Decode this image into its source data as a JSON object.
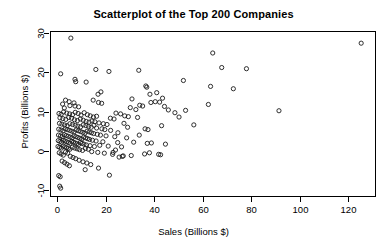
{
  "chart_data": {
    "type": "scatter",
    "title": "Scatterplot of the Top 200 Companies",
    "xlabel": "Sales (Billions $)",
    "ylabel": "Profits (Billions $)",
    "xlim": [
      -3,
      131
    ],
    "ylim": [
      -11.5,
      30.5
    ],
    "xticks": [
      0,
      20,
      40,
      60,
      80,
      100,
      120
    ],
    "xtick_labels": [
      "0",
      "20",
      "40",
      "60",
      "80",
      "100",
      "120"
    ],
    "yticks": [
      -10,
      0,
      10,
      20,
      30
    ],
    "ytick_labels": [
      "-10",
      "0",
      "10",
      "20",
      "30"
    ],
    "grid": false,
    "legend": null,
    "marker": "open-circle",
    "marker_color": "#1a1a1a",
    "n_points": 200,
    "points": [
      [
        5.6,
        28.7
      ],
      [
        125.3,
        27.4
      ],
      [
        64.1,
        24.9
      ],
      [
        1.4,
        19.6
      ],
      [
        67.8,
        21.2
      ],
      [
        78.0,
        20.9
      ],
      [
        15.9,
        20.7
      ],
      [
        33.6,
        20.5
      ],
      [
        21.3,
        20.2
      ],
      [
        7.3,
        18.2
      ],
      [
        7.6,
        17.6
      ],
      [
        11.9,
        17.5
      ],
      [
        52.0,
        17.9
      ],
      [
        63.2,
        16.4
      ],
      [
        72.6,
        15.8
      ],
      [
        18.0,
        15.0
      ],
      [
        36.5,
        16.5
      ],
      [
        36.9,
        16.2
      ],
      [
        16.8,
        14.4
      ],
      [
        38.2,
        14.4
      ],
      [
        41.0,
        14.8
      ],
      [
        43.4,
        13.4
      ],
      [
        30.8,
        13.2
      ],
      [
        14.8,
        12.9
      ],
      [
        3.4,
        12.9
      ],
      [
        4.9,
        12.5
      ],
      [
        6.9,
        12.2
      ],
      [
        17.0,
        12.3
      ],
      [
        18.3,
        12.1
      ],
      [
        2.2,
        11.9
      ],
      [
        5.2,
        11.5
      ],
      [
        7.3,
        11.4
      ],
      [
        8.8,
        11.2
      ],
      [
        2.9,
        10.9
      ],
      [
        40.4,
        12.5
      ],
      [
        42.2,
        12.4
      ],
      [
        38.6,
        12.3
      ],
      [
        62.3,
        11.8
      ],
      [
        44.2,
        11.3
      ],
      [
        34.0,
        11.6
      ],
      [
        35.2,
        11.4
      ],
      [
        30.1,
        11.0
      ],
      [
        32.4,
        10.5
      ],
      [
        45.8,
        10.4
      ],
      [
        52.9,
        10.3
      ],
      [
        91.4,
        10.2
      ],
      [
        48.5,
        9.7
      ],
      [
        24.2,
        9.6
      ],
      [
        26.1,
        9.4
      ],
      [
        0.7,
        9.5
      ],
      [
        1.6,
        9.3
      ],
      [
        2.6,
        9.9
      ],
      [
        3.9,
        9.6
      ],
      [
        5.1,
        9.4
      ],
      [
        6.3,
        9.2
      ],
      [
        7.4,
        9.8
      ],
      [
        8.6,
        9.5
      ],
      [
        9.8,
        9.1
      ],
      [
        11.1,
        9.7
      ],
      [
        12.4,
        9.2
      ],
      [
        13.6,
        8.9
      ],
      [
        14.9,
        8.6
      ],
      [
        16.2,
        8.8
      ],
      [
        27.8,
        8.9
      ],
      [
        29.3,
        8.7
      ],
      [
        33.1,
        8.5
      ],
      [
        50.2,
        8.6
      ],
      [
        56.3,
        6.6
      ],
      [
        43.0,
        6.4
      ],
      [
        21.9,
        8.3
      ],
      [
        23.4,
        8.1
      ],
      [
        1.1,
        8.4
      ],
      [
        2.3,
        8.2
      ],
      [
        3.5,
        8.0
      ],
      [
        4.7,
        8.5
      ],
      [
        5.9,
        8.3
      ],
      [
        7.1,
        7.9
      ],
      [
        8.3,
        7.7
      ],
      [
        9.5,
        8.1
      ],
      [
        10.7,
        7.8
      ],
      [
        11.9,
        7.5
      ],
      [
        13.1,
        7.3
      ],
      [
        14.3,
        7.6
      ],
      [
        15.5,
        7.4
      ],
      [
        17.2,
        7.1
      ],
      [
        19.0,
        6.9
      ],
      [
        20.5,
        6.7
      ],
      [
        36.2,
        5.6
      ],
      [
        37.4,
        5.4
      ],
      [
        0.9,
        7.0
      ],
      [
        1.9,
        6.8
      ],
      [
        3.0,
        6.6
      ],
      [
        4.1,
        6.4
      ],
      [
        5.2,
        6.9
      ],
      [
        6.3,
        6.7
      ],
      [
        7.4,
        6.5
      ],
      [
        8.5,
        6.3
      ],
      [
        9.6,
        6.1
      ],
      [
        10.7,
        6.6
      ],
      [
        11.8,
        6.4
      ],
      [
        12.9,
        6.2
      ],
      [
        14.0,
        6.0
      ],
      [
        15.1,
        6.5
      ],
      [
        16.2,
        5.8
      ],
      [
        18.4,
        5.6
      ],
      [
        19.6,
        5.4
      ],
      [
        22.0,
        5.2
      ],
      [
        25.0,
        4.6
      ],
      [
        0.6,
        5.5
      ],
      [
        1.5,
        5.3
      ],
      [
        2.4,
        5.1
      ],
      [
        3.3,
        5.6
      ],
      [
        4.2,
        5.4
      ],
      [
        5.1,
        5.2
      ],
      [
        6.0,
        5.0
      ],
      [
        6.9,
        4.8
      ],
      [
        7.8,
        5.3
      ],
      [
        8.7,
        5.1
      ],
      [
        9.6,
        4.9
      ],
      [
        10.5,
        4.7
      ],
      [
        11.4,
        4.5
      ],
      [
        12.3,
        5.0
      ],
      [
        13.2,
        4.8
      ],
      [
        14.1,
        4.6
      ],
      [
        15.0,
        4.4
      ],
      [
        16.5,
        4.2
      ],
      [
        17.8,
        4.0
      ],
      [
        20.1,
        3.8
      ],
      [
        23.7,
        3.6
      ],
      [
        28.6,
        3.3
      ],
      [
        0.5,
        4.0
      ],
      [
        1.3,
        3.8
      ],
      [
        2.1,
        3.6
      ],
      [
        2.9,
        4.1
      ],
      [
        3.7,
        3.9
      ],
      [
        4.5,
        3.7
      ],
      [
        5.3,
        3.5
      ],
      [
        6.1,
        3.3
      ],
      [
        6.9,
        3.8
      ],
      [
        7.7,
        3.6
      ],
      [
        8.5,
        3.4
      ],
      [
        9.3,
        3.2
      ],
      [
        10.1,
        3.0
      ],
      [
        10.9,
        3.5
      ],
      [
        11.7,
        3.3
      ],
      [
        12.5,
        3.1
      ],
      [
        13.3,
        2.9
      ],
      [
        14.5,
        2.7
      ],
      [
        16.0,
        2.5
      ],
      [
        18.8,
        2.3
      ],
      [
        24.9,
        2.1
      ],
      [
        37.1,
        1.9
      ],
      [
        38.8,
        2.0
      ],
      [
        44.6,
        1.7
      ],
      [
        0.4,
        2.6
      ],
      [
        1.1,
        2.4
      ],
      [
        1.8,
        2.2
      ],
      [
        2.5,
        2.7
      ],
      [
        3.2,
        2.5
      ],
      [
        3.9,
        2.3
      ],
      [
        4.6,
        2.1
      ],
      [
        5.3,
        1.9
      ],
      [
        6.0,
        2.4
      ],
      [
        6.7,
        2.2
      ],
      [
        7.4,
        2.0
      ],
      [
        8.1,
        1.8
      ],
      [
        8.8,
        1.6
      ],
      [
        9.5,
        2.1
      ],
      [
        10.2,
        1.9
      ],
      [
        11.0,
        1.7
      ],
      [
        12.0,
        1.5
      ],
      [
        13.5,
        1.3
      ],
      [
        15.3,
        1.1
      ],
      [
        17.5,
        1.4
      ],
      [
        21.0,
        1.2
      ],
      [
        26.5,
        1.0
      ],
      [
        0.3,
        1.1
      ],
      [
        1.0,
        0.9
      ],
      [
        1.7,
        0.7
      ],
      [
        2.4,
        1.2
      ],
      [
        3.1,
        1.0
      ],
      [
        3.8,
        0.8
      ],
      [
        4.5,
        0.6
      ],
      [
        5.2,
        0.4
      ],
      [
        6.2,
        0.9
      ],
      [
        7.2,
        0.7
      ],
      [
        8.2,
        0.5
      ],
      [
        9.2,
        0.3
      ],
      [
        10.4,
        0.1
      ],
      [
        11.6,
        0.6
      ],
      [
        12.8,
        0.4
      ],
      [
        14.2,
        -0.2
      ],
      [
        16.7,
        -0.4
      ],
      [
        19.4,
        -0.6
      ],
      [
        22.8,
        -0.9
      ],
      [
        27.2,
        -1.3
      ],
      [
        36.0,
        -0.8
      ],
      [
        38.0,
        -0.5
      ],
      [
        42.6,
        -1.0
      ],
      [
        0.8,
        -0.5
      ],
      [
        1.6,
        -0.8
      ],
      [
        2.5,
        -1.1
      ],
      [
        3.4,
        -0.3
      ],
      [
        4.3,
        -0.6
      ],
      [
        5.4,
        -1.4
      ],
      [
        6.5,
        -1.7
      ],
      [
        7.6,
        -2.0
      ],
      [
        9.0,
        -2.4
      ],
      [
        10.6,
        -2.8
      ],
      [
        12.2,
        -3.1
      ],
      [
        13.8,
        -3.5
      ],
      [
        2.0,
        -2.6
      ],
      [
        3.0,
        -3.0
      ],
      [
        4.0,
        -3.4
      ],
      [
        5.0,
        -3.8
      ],
      [
        11.5,
        -4.8
      ],
      [
        17.0,
        -4.4
      ],
      [
        21.5,
        -6.2
      ],
      [
        0.6,
        -6.3
      ],
      [
        1.2,
        -6.6
      ],
      [
        1.0,
        -9.0
      ],
      [
        1.4,
        -9.5
      ],
      [
        25.5,
        -1.6
      ],
      [
        26.8,
        -1.4
      ],
      [
        30.5,
        -1.2
      ],
      [
        41.8,
        -0.9
      ],
      [
        31.5,
        2.2
      ],
      [
        33.8,
        4.0
      ],
      [
        29.0,
        6.0
      ],
      [
        27.5,
        7.0
      ],
      [
        24.0,
        0.2
      ],
      [
        23.0,
        -0.4
      ]
    ]
  },
  "plot_geometry": {
    "box_left": 50,
    "box_right": 375,
    "box_top": 31,
    "box_bottom": 196
  }
}
